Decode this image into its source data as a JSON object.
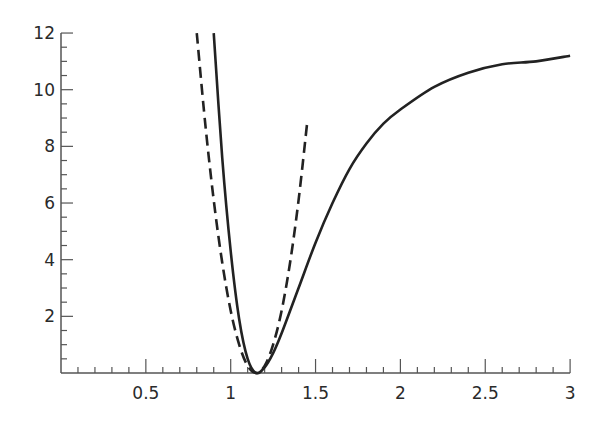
{
  "chart_data": {
    "type": "line",
    "title": "",
    "xlabel": "",
    "ylabel": "",
    "xlim": [
      0,
      3
    ],
    "ylim": [
      0,
      12
    ],
    "grid": false,
    "legend": null,
    "x_ticks": [
      0.5,
      1,
      1.5,
      2,
      2.5,
      3
    ],
    "x_tick_labels": [
      "0.5",
      "1",
      "1.5",
      "2",
      "2.5",
      "3"
    ],
    "y_ticks": [
      2,
      4,
      6,
      8,
      10,
      12
    ],
    "y_tick_labels": [
      "2",
      "4",
      "6",
      "8",
      "10",
      "12"
    ],
    "series": [
      {
        "name": "solid (Morse-like potential)",
        "style": "solid",
        "color": "#222222",
        "x": [
          0.9,
          0.95,
          1.0,
          1.05,
          1.1,
          1.15,
          1.2,
          1.25,
          1.3,
          1.4,
          1.5,
          1.6,
          1.7,
          1.8,
          1.9,
          2.0,
          2.2,
          2.4,
          2.6,
          2.8,
          3.0
        ],
        "y": [
          12.0,
          7.6,
          4.3,
          1.9,
          0.5,
          0.0,
          0.2,
          0.7,
          1.4,
          3.0,
          4.6,
          6.0,
          7.2,
          8.1,
          8.8,
          9.3,
          10.1,
          10.6,
          10.9,
          11.0,
          11.2
        ]
      },
      {
        "name": "dashed (harmonic approximation)",
        "style": "dashed",
        "color": "#222222",
        "x": [
          0.8,
          0.85,
          0.9,
          0.95,
          1.0,
          1.05,
          1.1,
          1.15,
          1.2,
          1.25,
          1.3,
          1.35,
          1.4,
          1.45
        ],
        "y": [
          12.0,
          8.8,
          6.1,
          3.9,
          2.2,
          1.0,
          0.25,
          0.0,
          0.25,
          1.0,
          2.2,
          3.9,
          6.1,
          8.8
        ]
      }
    ]
  }
}
